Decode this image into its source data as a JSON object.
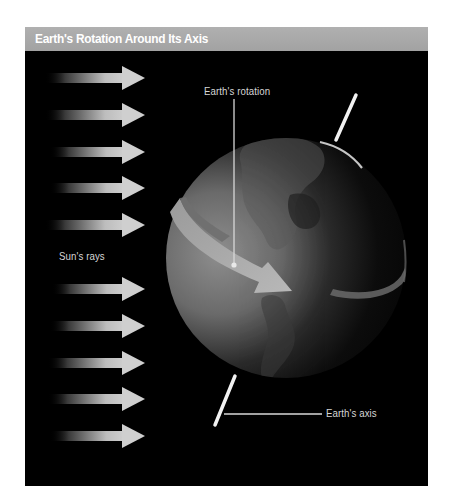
{
  "title": "Earth's Rotation Around Its Axis",
  "labels": {
    "earth_rotation": "Earth's rotation",
    "suns_rays": "Sun's rays",
    "earth_axis": "Earth's axis"
  },
  "diagram": {
    "background": "#000000",
    "title_bar_color": "#a8a8a8",
    "ray_color": "#c8c8c8",
    "sun_ray_arrows": [
      {
        "y": 78
      },
      {
        "y": 115
      },
      {
        "y": 152
      },
      {
        "y": 188
      },
      {
        "y": 225
      },
      {
        "y": 289
      },
      {
        "y": 326
      },
      {
        "y": 363
      },
      {
        "y": 399
      },
      {
        "y": 436
      }
    ],
    "globe": {
      "cx": 286,
      "cy": 258,
      "r": 120,
      "lit_side": "left"
    },
    "axis_line": {
      "top": [
        356,
        95,
        337,
        138
      ],
      "bottom": [
        235,
        376,
        215,
        425
      ]
    }
  }
}
